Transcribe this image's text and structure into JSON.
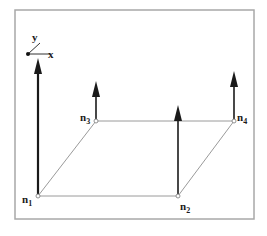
{
  "diagram": {
    "type": "plate-element-with-nodal-vectors",
    "frame": {
      "x": 15,
      "y": 10,
      "width": 239,
      "height": 209,
      "stroke": "#a8a8a8"
    },
    "axes": {
      "origin": {
        "x": 28,
        "y": 54
      },
      "x_label": "x",
      "y_label": "y",
      "x_end": {
        "x": 50,
        "y": 54
      },
      "y_end": {
        "x": 40,
        "y": 43
      }
    },
    "edge_color": "#9a9a9a",
    "arrow_color": "#1a1a1a",
    "nodes": [
      {
        "id": "n1",
        "label": "n",
        "sub": "1",
        "x": 38,
        "y": 196,
        "arrow_tip_y": 58,
        "label_x": 22,
        "label_y": 203
      },
      {
        "id": "n2",
        "label": "n",
        "sub": "2",
        "x": 178,
        "y": 196,
        "arrow_tip_y": 105,
        "label_x": 180,
        "label_y": 210
      },
      {
        "id": "n3",
        "label": "n",
        "sub": "3",
        "x": 96,
        "y": 121,
        "arrow_tip_y": 81,
        "label_x": 80,
        "label_y": 121
      },
      {
        "id": "n4",
        "label": "n",
        "sub": "4",
        "x": 234,
        "y": 121,
        "arrow_tip_y": 71,
        "label_x": 237,
        "label_y": 121
      }
    ],
    "edges": [
      [
        "n1",
        "n2"
      ],
      [
        "n2",
        "n4"
      ],
      [
        "n4",
        "n3"
      ],
      [
        "n3",
        "n1"
      ]
    ]
  }
}
